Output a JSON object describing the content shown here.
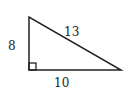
{
  "diagram": {
    "type": "right-triangle",
    "colors": {
      "stroke": "#222222",
      "background": "#ffffff"
    },
    "labels": {
      "left_side": "8",
      "hypotenuse": "13",
      "bottom_side": "10"
    }
  }
}
